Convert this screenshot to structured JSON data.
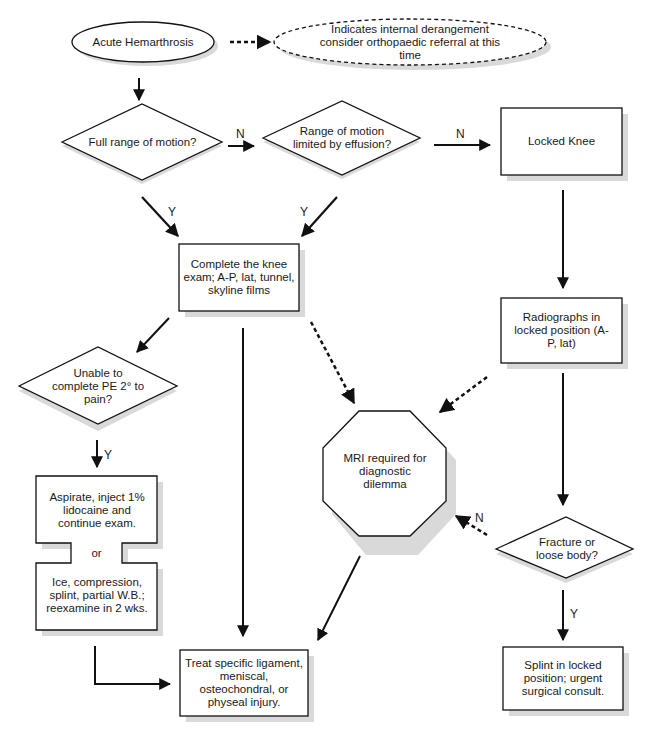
{
  "diagram": {
    "type": "flowchart",
    "nodes": {
      "start": "Acute Hemarthrosis",
      "note": "Indicates internal derangement consider orthopaedic referral at this time",
      "q_full_rom": "Full range of motion?",
      "q_rom_effusion": "Range of motion limited by effusion?",
      "locked_knee": "Locked Knee",
      "complete_exam": "Complete the knee exam; A-P, lat, tunnel, skyline films",
      "radiographs": "Radiographs in locked position (A-P, lat)",
      "q_unable_pe": "Unable to complete PE 2° to pain?",
      "mri": "MRI required for diagnostic dilemma",
      "aspirate": "Aspirate, inject 1% lidocaine and continue exam.",
      "or": "or",
      "ice": "Ice, compression, splint, partial W.B.; reexamine in 2 wks.",
      "q_fracture": "Fracture or loose body?",
      "treat": "Treat specific ligament, meniscal, osteochondral, or physeal injury.",
      "splint": "Splint in locked position; urgent surgical consult."
    },
    "edge_labels": {
      "no1": "N",
      "no2": "N",
      "yes1": "Y",
      "yes2": "Y",
      "yes3": "Y",
      "no3": "N",
      "yes4": "Y"
    },
    "colors": {
      "stroke": "#111111",
      "shadow": "#d9d9d9",
      "fill": "#ffffff"
    }
  }
}
